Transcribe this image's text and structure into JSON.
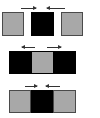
{
  "diagram": {
    "rows": [
      {
        "name": "row-1",
        "layout": "separate",
        "cells": [
          "gray",
          "black",
          "gray"
        ],
        "arrows": [
          {
            "direction": "right",
            "position": "left"
          },
          {
            "direction": "left",
            "position": "right"
          }
        ]
      },
      {
        "name": "row-2",
        "layout": "joined",
        "cells": [
          "black",
          "gray",
          "black"
        ],
        "arrows": [
          {
            "direction": "left",
            "position": "left"
          },
          {
            "direction": "right",
            "position": "right"
          }
        ]
      },
      {
        "name": "row-3",
        "layout": "joined",
        "cells": [
          "gray",
          "black",
          "gray"
        ],
        "arrows": [
          {
            "direction": "right",
            "position": "left"
          },
          {
            "direction": "left",
            "position": "right"
          }
        ]
      }
    ],
    "colors": {
      "gray": "#a8a8a8",
      "black": "#000000",
      "arrow": "#333333",
      "background": "#ffffff"
    }
  }
}
